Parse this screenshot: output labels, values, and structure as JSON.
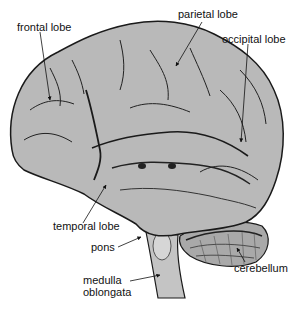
{
  "diagram": {
    "colors": {
      "brain_fill": "#b9b9b9",
      "brain_dark": "#8f8f8f",
      "outline": "#1a1a1a",
      "background": "#ffffff"
    },
    "labels": [
      {
        "id": "frontal",
        "text": "frontal lobe"
      },
      {
        "id": "parietal",
        "text": "parietal lobe"
      },
      {
        "id": "occipital",
        "text": "occipital lobe"
      },
      {
        "id": "temporal",
        "text": "temporal lobe"
      },
      {
        "id": "pons",
        "text": "pons"
      },
      {
        "id": "cerebellum",
        "text": "cerebellum"
      },
      {
        "id": "medulla",
        "text": "medulla oblongata",
        "lines": [
          "medulla",
          "oblongata"
        ]
      }
    ]
  }
}
